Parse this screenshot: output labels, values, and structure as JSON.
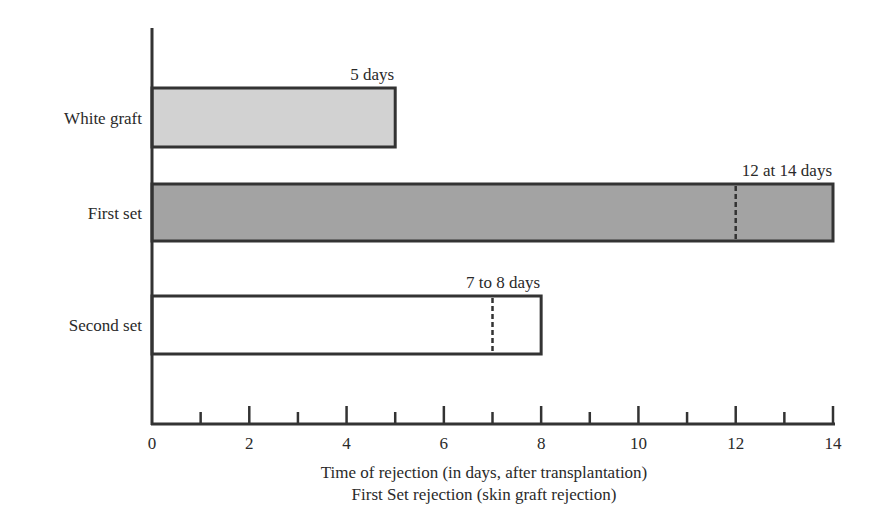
{
  "chart_data": {
    "type": "bar",
    "orientation": "horizontal",
    "title": "",
    "xlabel": "Time of rejection (in days, after transplantation)",
    "subtitle": "First Set rejection (skin graft rejection)",
    "ylabel": "",
    "xlim": [
      0,
      14
    ],
    "x_ticks_major": [
      0,
      2,
      4,
      6,
      8,
      10,
      12,
      14
    ],
    "x_ticks_minor": [
      1,
      3,
      5,
      7,
      9,
      11,
      13
    ],
    "grid": false,
    "legend": null,
    "categories": [
      "White graft",
      "First set",
      "Second set"
    ],
    "bars": [
      {
        "label": "White graft",
        "start": 0,
        "end": 5,
        "marker": null,
        "annotation": "5 days",
        "fill": "#d2d2d2"
      },
      {
        "label": "First set",
        "start": 0,
        "end": 14,
        "marker": 12,
        "annotation": "12 at 14 days",
        "fill": "#a3a3a3"
      },
      {
        "label": "Second set",
        "start": 0,
        "end": 8,
        "marker": 7,
        "annotation": "7 to 8 days",
        "fill": "#ffffff"
      }
    ]
  },
  "colors": {
    "axis": "#333333",
    "outline": "#333333",
    "text": "#2a2a2a"
  }
}
